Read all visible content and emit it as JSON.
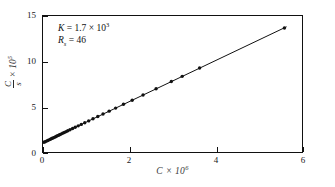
{
  "chart_data": {
    "type": "scatter",
    "title": "",
    "subtitle": "",
    "xlabel": "C × 10⁶",
    "xlabel_parts": {
      "symbol": "C",
      "times": "×",
      "base": "10",
      "exponent": "6"
    },
    "ylabel": "C/s × 10⁵",
    "ylabel_parts": {
      "numerator": "C",
      "denominator": "s",
      "times": "×",
      "base": "10",
      "exponent": "5"
    },
    "xlim": [
      0,
      6
    ],
    "ylim": [
      0,
      15
    ],
    "xticks": [
      0,
      2,
      4,
      6
    ],
    "xticklabels": [
      "0",
      "2",
      "4",
      "6"
    ],
    "yticks": [
      0,
      5,
      10,
      15
    ],
    "yticklabels": [
      "0",
      "5",
      "10",
      "15"
    ],
    "grid": false,
    "legend": null,
    "marker": "filled-circle",
    "line_style": "solid",
    "series": [
      {
        "name": "C/s vs C",
        "x": [
          0.02,
          0.05,
          0.08,
          0.11,
          0.14,
          0.17,
          0.2,
          0.23,
          0.26,
          0.29,
          0.32,
          0.35,
          0.38,
          0.41,
          0.45,
          0.49,
          0.53,
          0.57,
          0.62,
          0.68,
          0.74,
          0.81,
          0.88,
          0.96,
          1.05,
          1.15,
          1.26,
          1.38,
          1.52,
          1.67,
          1.85,
          2.05,
          2.3,
          2.6,
          2.95,
          3.2,
          3.6,
          5.55
        ],
        "y": [
          1.28,
          1.33,
          1.4,
          1.47,
          1.54,
          1.61,
          1.68,
          1.74,
          1.81,
          1.88,
          1.95,
          2.02,
          2.09,
          2.16,
          2.25,
          2.34,
          2.43,
          2.52,
          2.63,
          2.77,
          2.9,
          3.06,
          3.22,
          3.4,
          3.6,
          3.83,
          4.07,
          4.34,
          4.66,
          4.99,
          5.4,
          5.85,
          6.42,
          7.09,
          7.88,
          8.44,
          9.34,
          13.7
        ]
      }
    ],
    "fit_line": {
      "intercept": 1.23,
      "slope": 2.25,
      "x_start": 0.0,
      "x_end": 5.6
    },
    "annotations": [
      {
        "symbol": "K",
        "equals": "=",
        "value": "1.7",
        "times": "×",
        "base": "10",
        "exponent": "3"
      },
      {
        "symbol": "R",
        "subscript": "s",
        "equals": "=",
        "value": "46"
      }
    ],
    "colors": {
      "line": "#111111",
      "marker": "#111111",
      "axis": "#111111",
      "background": "#ffffff"
    }
  }
}
